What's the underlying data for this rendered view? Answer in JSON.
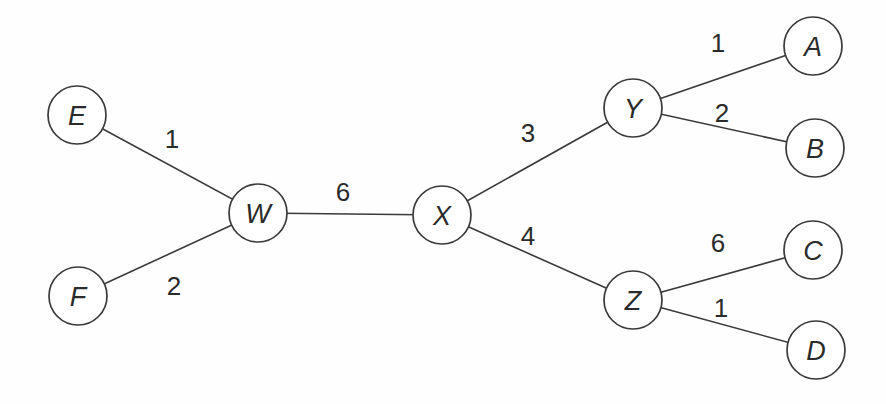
{
  "diagram": {
    "type": "weighted-graph",
    "background_color": "#fefefe",
    "stroke_color": "#3a3a3a",
    "node_fill_color": "#ffffff",
    "text_color": "#2b2b2b",
    "node_radius": 29,
    "edge_stroke_width": 1.6,
    "nodes": [
      {
        "id": "E",
        "label": "E",
        "x": 77,
        "y": 115
      },
      {
        "id": "F",
        "label": "F",
        "x": 78,
        "y": 296
      },
      {
        "id": "W",
        "label": "W",
        "x": 258,
        "y": 213
      },
      {
        "id": "X",
        "label": "X",
        "x": 442,
        "y": 215
      },
      {
        "id": "Y",
        "label": "Y",
        "x": 633,
        "y": 108
      },
      {
        "id": "Z",
        "label": "Z",
        "x": 633,
        "y": 300
      },
      {
        "id": "A",
        "label": "A",
        "x": 813,
        "y": 46
      },
      {
        "id": "B",
        "label": "B",
        "x": 815,
        "y": 148
      },
      {
        "id": "C",
        "label": "C",
        "x": 813,
        "y": 250
      },
      {
        "id": "D",
        "label": "D",
        "x": 816,
        "y": 350
      }
    ],
    "edges": [
      {
        "from": "E",
        "to": "W",
        "weight": "1",
        "label_x": 172,
        "label_y": 139
      },
      {
        "from": "F",
        "to": "W",
        "weight": "2",
        "label_x": 174,
        "label_y": 286
      },
      {
        "from": "W",
        "to": "X",
        "weight": "6",
        "label_x": 343,
        "label_y": 192
      },
      {
        "from": "X",
        "to": "Y",
        "weight": "3",
        "label_x": 528,
        "label_y": 133
      },
      {
        "from": "X",
        "to": "Z",
        "weight": "4",
        "label_x": 528,
        "label_y": 236
      },
      {
        "from": "Y",
        "to": "A",
        "weight": "1",
        "label_x": 718,
        "label_y": 43
      },
      {
        "from": "Y",
        "to": "B",
        "weight": "2",
        "label_x": 722,
        "label_y": 113
      },
      {
        "from": "Z",
        "to": "C",
        "weight": "6",
        "label_x": 718,
        "label_y": 243
      },
      {
        "from": "Z",
        "to": "D",
        "weight": "1",
        "label_x": 721,
        "label_y": 308
      }
    ]
  }
}
